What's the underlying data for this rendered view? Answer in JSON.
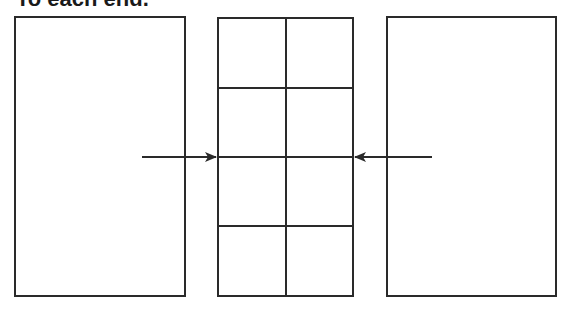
{
  "caption": "To each end.",
  "diagram": {
    "left_panel": {
      "x": 15,
      "y": 17,
      "w": 170,
      "h": 279
    },
    "center_grid": {
      "x": 218,
      "y": 18,
      "w": 135,
      "h": 278,
      "cols": 2,
      "rows": 4
    },
    "right_panel": {
      "x": 387,
      "y": 17,
      "w": 169,
      "h": 279
    },
    "arrows": [
      {
        "from": [
          142,
          157
        ],
        "to": [
          216,
          157
        ],
        "direction": "right"
      },
      {
        "from": [
          432,
          157
        ],
        "to": [
          355,
          157
        ],
        "direction": "left"
      }
    ],
    "stroke_color": "#2a2a2a"
  }
}
